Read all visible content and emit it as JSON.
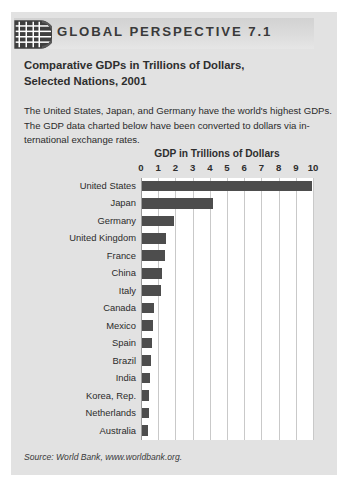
{
  "header": {
    "title": "GLOBAL PERSPECTIVE 7.1",
    "logo_icon": "globe-grid-icon"
  },
  "caption": {
    "line1": "Comparative GDPs in Trillions of Dollars,",
    "line2": "Selected Nations, 2001"
  },
  "blurb": {
    "line1": "The United States, Japan, and Germany have the world's highest GDPs.",
    "line2": "The GDP data charted below have been converted to dollars via in-",
    "line3": "ternational exchange rates."
  },
  "source": "Source: World Bank, www.worldbank.org.",
  "colors": {
    "panel_background": "#e2e2e2",
    "plot_background": "#ffffff",
    "bar": "#4d4d4d",
    "gridline": "#c9c9c9",
    "text": "#2b2b2b"
  },
  "chart_data": {
    "type": "bar",
    "orientation": "horizontal",
    "title": "GDP in Trillions of Dollars",
    "xlabel": "GDP in Trillions of Dollars",
    "ylabel": "",
    "xlim": [
      0,
      10
    ],
    "xticks": [
      0,
      1,
      2,
      3,
      4,
      5,
      6,
      7,
      8,
      9,
      10
    ],
    "xtick_labels": [
      "0",
      "1",
      "2",
      "3",
      "4",
      "5",
      "6",
      "7",
      "8",
      "9",
      "10"
    ],
    "grid": true,
    "legend": "none",
    "categories": [
      "United States",
      "Japan",
      "Germany",
      "United Kingdom",
      "France",
      "China",
      "Italy",
      "Canada",
      "Mexico",
      "Spain",
      "Brazil",
      "India",
      "Korea, Rep.",
      "Netherlands",
      "Australia"
    ],
    "values": [
      9.9,
      4.1,
      1.85,
      1.42,
      1.31,
      1.16,
      1.09,
      0.7,
      0.62,
      0.58,
      0.5,
      0.48,
      0.42,
      0.38,
      0.37
    ]
  }
}
